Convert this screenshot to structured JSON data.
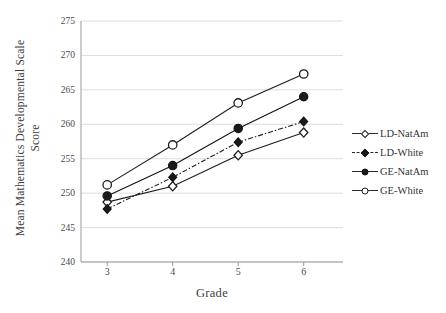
{
  "chart_data": {
    "type": "line",
    "title": "",
    "xlabel": "Grade",
    "ylabel_line1": "Mean Mathematics Developmental Scale",
    "ylabel_line2": "Score",
    "categories": [
      3,
      4,
      5,
      6
    ],
    "x": [
      3,
      4,
      5,
      6
    ],
    "xtick_labels": [
      "3",
      "4",
      "5",
      "6"
    ],
    "ytick_labels": [
      "240",
      "245",
      "250",
      "255",
      "260",
      "265",
      "270",
      "275"
    ],
    "yticks": [
      240,
      245,
      250,
      255,
      260,
      265,
      270,
      275
    ],
    "ylim": [
      240,
      275
    ],
    "xlim": [
      2.6,
      6.6
    ],
    "grid": "horizontal",
    "grid_color": "#d9d9d9",
    "legend_position": "right",
    "series": [
      {
        "name": "LD-NatAm",
        "values": [
          248.7,
          251.0,
          255.5,
          258.8
        ],
        "marker": "diamond-open",
        "line_style": "solid",
        "color": "#1d1d1d"
      },
      {
        "name": "LD-White",
        "values": [
          247.7,
          252.3,
          257.4,
          260.4
        ],
        "marker": "diamond-filled",
        "line_style": "dash-dot",
        "color": "#1d1d1d"
      },
      {
        "name": "GE-NatAm",
        "values": [
          249.6,
          254.0,
          259.4,
          264.0
        ],
        "marker": "circle-filled",
        "line_style": "solid",
        "color": "#111111"
      },
      {
        "name": "GE-White",
        "values": [
          251.2,
          257.0,
          263.1,
          267.3
        ],
        "marker": "circle-open",
        "line_style": "solid",
        "color": "#1d1d1d"
      }
    ]
  },
  "legend": {
    "items": [
      {
        "label": "LD-NatAm"
      },
      {
        "label": "LD-White"
      },
      {
        "label": "GE-NatAm"
      },
      {
        "label": "GE-White"
      }
    ]
  }
}
